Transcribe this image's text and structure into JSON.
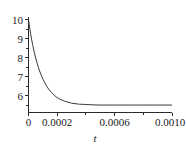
{
  "chart_data": {
    "type": "line",
    "title": "",
    "xlabel": "t",
    "ylabel": "",
    "xlim": [
      0,
      0.001
    ],
    "ylim": [
      5.0,
      10.0
    ],
    "grid": false,
    "legend": null,
    "x_ticks": [
      {
        "value": 0,
        "label": "0"
      },
      {
        "value": 0.0002,
        "label": "0.0002"
      },
      {
        "value": 0.0006,
        "label": "0.0006"
      },
      {
        "value": 0.001,
        "label": "0.0010"
      }
    ],
    "x_minor_ticks": [
      0.0001,
      0.0003,
      0.0004,
      0.0005,
      0.0007,
      0.0008,
      0.0009
    ],
    "y_ticks": [
      {
        "value": 10,
        "label": "10"
      },
      {
        "value": 9,
        "label": "9"
      },
      {
        "value": 8,
        "label": "8"
      },
      {
        "value": 7,
        "label": "7"
      },
      {
        "value": 6,
        "label": "6"
      }
    ],
    "series": [
      {
        "name": "exponential decay",
        "description": "decays from 10 at t=0 to asymptote near 5.4",
        "asymptote": 5.4,
        "initial_value": 10.0,
        "x": [
          0,
          1e-05,
          2e-05,
          3e-05,
          4e-05,
          5e-05,
          6e-05,
          7e-05,
          8e-05,
          9e-05,
          0.0001,
          0.00012,
          0.00014,
          0.00016,
          0.00018,
          0.0002,
          0.00022,
          0.00025,
          0.0003,
          0.00035,
          0.0004,
          0.00045,
          0.0005,
          0.0006,
          0.0007,
          0.0008,
          0.0009,
          0.001
        ],
        "y": [
          10.0,
          9.46,
          9.0,
          8.6,
          8.24,
          7.93,
          7.65,
          7.4,
          7.18,
          6.98,
          6.8,
          6.5,
          6.26,
          6.07,
          5.92,
          5.8,
          5.71,
          5.61,
          5.5,
          5.45,
          5.43,
          5.41,
          5.4,
          5.4,
          5.4,
          5.4,
          5.4,
          5.4
        ]
      }
    ]
  },
  "colors": {
    "curve": "#3a3a3a",
    "axis": "#2b2b2b",
    "text": "#1a1a1a",
    "background": "#ffffff"
  }
}
